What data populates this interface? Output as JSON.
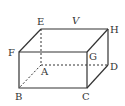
{
  "diagram": {
    "type": "rectangular-prism",
    "labels": {
      "E": "E",
      "V": "V",
      "H": "H",
      "F": "F",
      "G": "G",
      "A": "A",
      "D": "D",
      "B": "B",
      "C": "C"
    },
    "colors": {
      "stroke": "#333333",
      "background": "#ffffff"
    }
  }
}
